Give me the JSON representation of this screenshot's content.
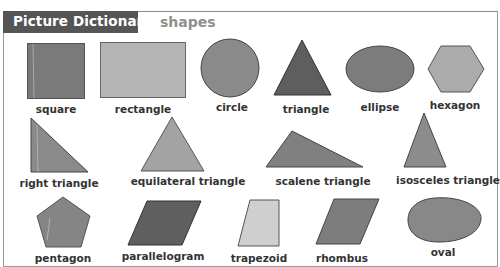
{
  "header": {
    "title": "Picture Dictionary",
    "subtitle": "shapes"
  },
  "colors": {
    "title_bg": "#555555",
    "shape_dark": "#6e6e6e",
    "shape_mid": "#8c8c8c",
    "shape_light": "#b0b0b0",
    "shape_lighter": "#cfcfcf",
    "outline": "#444444"
  },
  "shapes": {
    "row1": [
      {
        "label": "square",
        "icon": "square-icon"
      },
      {
        "label": "rectangle",
        "icon": "rectangle-icon"
      },
      {
        "label": "circle",
        "icon": "circle-icon"
      },
      {
        "label": "triangle",
        "icon": "triangle-icon"
      },
      {
        "label": "ellipse",
        "icon": "ellipse-icon"
      },
      {
        "label": "hexagon",
        "icon": "hexagon-icon"
      }
    ],
    "row2": [
      {
        "label": "right triangle",
        "icon": "right-triangle-icon"
      },
      {
        "label": "equilateral triangle",
        "icon": "equilateral-triangle-icon"
      },
      {
        "label": "scalene triangle",
        "icon": "scalene-triangle-icon"
      },
      {
        "label": "isosceles triangle",
        "icon": "isosceles-triangle-icon"
      }
    ],
    "row3": [
      {
        "label": "pentagon",
        "icon": "pentagon-icon"
      },
      {
        "label": "parallelogram",
        "icon": "parallelogram-icon"
      },
      {
        "label": "trapezoid",
        "icon": "trapezoid-icon"
      },
      {
        "label": "rhombus",
        "icon": "rhombus-icon"
      },
      {
        "label": "oval",
        "icon": "oval-icon"
      }
    ]
  }
}
